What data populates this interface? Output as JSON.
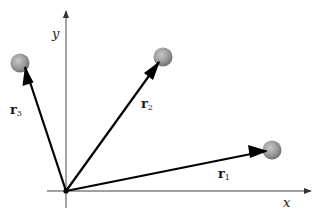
{
  "axes": {
    "x_label": "x",
    "y_label": "y"
  },
  "vectors": [
    {
      "name": "r",
      "subscript": "1"
    },
    {
      "name": "r",
      "subscript": "2"
    },
    {
      "name": "r",
      "subscript": "3"
    }
  ],
  "colors": {
    "axis": "#555555",
    "vector": "#000000",
    "sphere": "#8c8c8c",
    "sphere_highlight": "#c8c8c8"
  }
}
